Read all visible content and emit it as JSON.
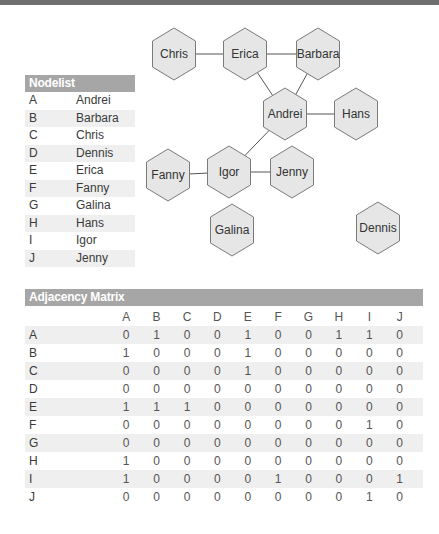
{
  "graph": {
    "nodes": [
      {
        "id": "A",
        "name": "Andrei",
        "cx": 285,
        "cy": 114
      },
      {
        "id": "B",
        "name": "Barbara",
        "cx": 318,
        "cy": 54
      },
      {
        "id": "C",
        "name": "Chris",
        "cx": 174,
        "cy": 54
      },
      {
        "id": "D",
        "name": "Dennis",
        "cx": 378,
        "cy": 228
      },
      {
        "id": "E",
        "name": "Erica",
        "cx": 245,
        "cy": 54
      },
      {
        "id": "F",
        "name": "Fanny",
        "cx": 168,
        "cy": 175
      },
      {
        "id": "G",
        "name": "Galina",
        "cx": 232,
        "cy": 230
      },
      {
        "id": "H",
        "name": "Hans",
        "cx": 356,
        "cy": 114
      },
      {
        "id": "I",
        "name": "Igor",
        "cx": 229,
        "cy": 172
      },
      {
        "id": "J",
        "name": "Jenny",
        "cx": 292,
        "cy": 172
      }
    ],
    "edges": [
      [
        "C",
        "E"
      ],
      [
        "E",
        "B"
      ],
      [
        "E",
        "A"
      ],
      [
        "B",
        "A"
      ],
      [
        "A",
        "H"
      ],
      [
        "A",
        "I"
      ],
      [
        "F",
        "I"
      ],
      [
        "I",
        "J"
      ]
    ],
    "colors": {
      "hex_fill": "#e6e6e6",
      "hex_stroke": "#7a7a7a",
      "edge": "#555555"
    }
  },
  "nodelist": {
    "title": "Nodelist",
    "rows": [
      {
        "key": "A",
        "name": "Andrei"
      },
      {
        "key": "B",
        "name": "Barbara"
      },
      {
        "key": "C",
        "name": "Chris"
      },
      {
        "key": "D",
        "name": "Dennis"
      },
      {
        "key": "E",
        "name": "Erica"
      },
      {
        "key": "F",
        "name": "Fanny"
      },
      {
        "key": "G",
        "name": "Galina"
      },
      {
        "key": "H",
        "name": "Hans"
      },
      {
        "key": "I",
        "name": "Igor"
      },
      {
        "key": "J",
        "name": "Jenny"
      }
    ]
  },
  "matrix": {
    "title": "Adjacency Matrix",
    "columns": [
      "A",
      "B",
      "C",
      "D",
      "E",
      "F",
      "G",
      "H",
      "I",
      "J"
    ],
    "rows": [
      {
        "label": "A",
        "values": [
          0,
          1,
          0,
          0,
          1,
          0,
          0,
          1,
          1,
          0
        ]
      },
      {
        "label": "B",
        "values": [
          1,
          0,
          0,
          0,
          1,
          0,
          0,
          0,
          0,
          0
        ]
      },
      {
        "label": "C",
        "values": [
          0,
          0,
          0,
          0,
          1,
          0,
          0,
          0,
          0,
          0
        ]
      },
      {
        "label": "D",
        "values": [
          0,
          0,
          0,
          0,
          0,
          0,
          0,
          0,
          0,
          0
        ]
      },
      {
        "label": "E",
        "values": [
          1,
          1,
          1,
          0,
          0,
          0,
          0,
          0,
          0,
          0
        ]
      },
      {
        "label": "F",
        "values": [
          0,
          0,
          0,
          0,
          0,
          0,
          0,
          0,
          1,
          0
        ]
      },
      {
        "label": "G",
        "values": [
          0,
          0,
          0,
          0,
          0,
          0,
          0,
          0,
          0,
          0
        ]
      },
      {
        "label": "H",
        "values": [
          1,
          0,
          0,
          0,
          0,
          0,
          0,
          0,
          0,
          0
        ]
      },
      {
        "label": "I",
        "values": [
          1,
          0,
          0,
          0,
          0,
          1,
          0,
          0,
          0,
          1
        ]
      },
      {
        "label": "J",
        "values": [
          0,
          0,
          0,
          0,
          0,
          0,
          0,
          0,
          1,
          0
        ]
      }
    ]
  }
}
